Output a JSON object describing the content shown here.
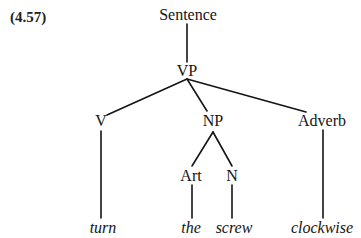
{
  "example_number": "(4.57)",
  "tree": {
    "nodes": {
      "sentence": "Sentence",
      "vp": "VP",
      "v": "V",
      "np": "NP",
      "adverb": "Adverb",
      "art": "Art",
      "n": "N"
    },
    "leaves": {
      "turn": "turn",
      "the": "the",
      "screw": "screw",
      "clockwise": "clockwise"
    },
    "structure": "[Sentence [VP [V turn] [NP [Art the] [N screw]] [Adverb clockwise]]]"
  }
}
